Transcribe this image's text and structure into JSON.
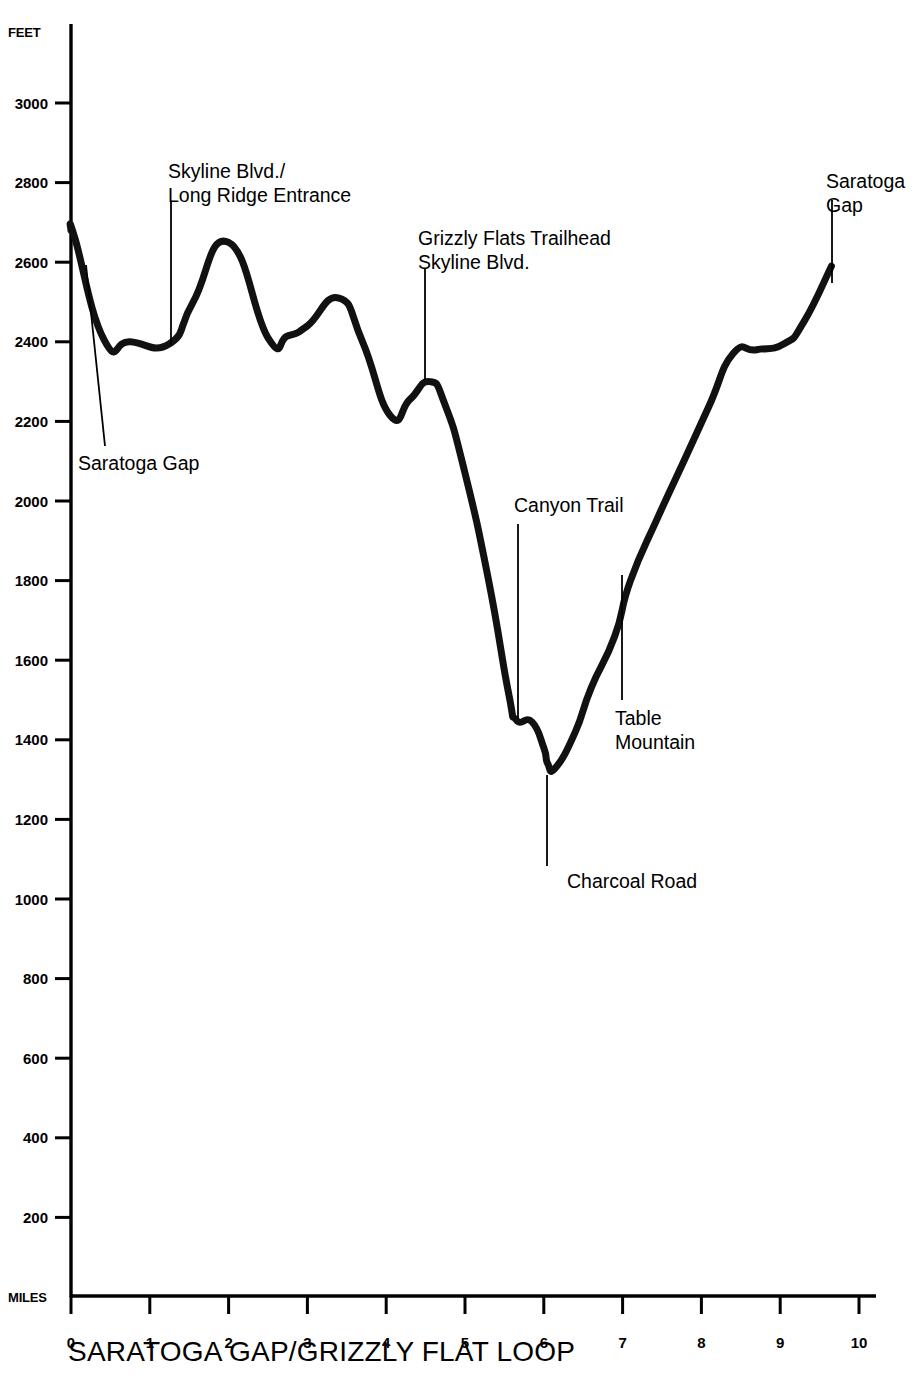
{
  "chart_data": {
    "type": "line",
    "title": "SARATOGA GAP/GRIZZLY FLAT LOOP",
    "xlabel": "MILES",
    "ylabel": "FEET",
    "xlim": [
      0,
      10
    ],
    "ylim": [
      0,
      3100
    ],
    "grid": false,
    "legend": "none",
    "x_ticks": [
      "0",
      "1",
      "2",
      "3",
      "4",
      "5",
      "6",
      "7",
      "8",
      "9",
      "10"
    ],
    "y_ticks": [
      "200",
      "400",
      "600",
      "800",
      "1000",
      "1200",
      "1400",
      "1600",
      "1800",
      "2000",
      "2200",
      "2400",
      "2600",
      "2800",
      "3000"
    ],
    "series": [
      {
        "name": "Elevation profile",
        "x": [
          0.0,
          0.05,
          0.42,
          0.75,
          1.25,
          1.55,
          2.0,
          2.5,
          2.75,
          3.0,
          3.4,
          3.7,
          4.05,
          4.3,
          4.55,
          4.75,
          5.0,
          5.3,
          5.55,
          5.65,
          5.85,
          6.0,
          6.05,
          6.15,
          6.4,
          6.6,
          6.9,
          7.1,
          7.45,
          7.8,
          8.1,
          8.4,
          8.7,
          9.05,
          9.3,
          9.65
        ],
        "y": [
          2680,
          2660,
          2405,
          2400,
          2395,
          2500,
          2650,
          2410,
          2415,
          2440,
          2510,
          2400,
          2215,
          2255,
          2300,
          2240,
          2070,
          1800,
          1520,
          1450,
          1445,
          1380,
          1340,
          1330,
          1420,
          1530,
          1660,
          1800,
          1960,
          2110,
          2240,
          2370,
          2380,
          2395,
          2450,
          2590
        ]
      }
    ],
    "annotations": [
      {
        "id": "saratoga-gap-start",
        "lines": [
          "Saratoga Gap"
        ],
        "mile": 0.05,
        "elevation": 2640,
        "text_x": 78,
        "text_y": 470,
        "leader_x1": 86,
        "leader_y1": 265,
        "leader_x2": 105,
        "leader_y2": 446
      },
      {
        "id": "skyline-blvd-long-ridge-entrance",
        "lines": [
          "Skyline Blvd./",
          "Long Ridge Entrance"
        ],
        "mile": 1.25,
        "elevation": 2395,
        "text_x": 168,
        "text_y": 178,
        "leader_x1": 171,
        "leader_y1": 201,
        "leader_x2": 171,
        "leader_y2": 345
      },
      {
        "id": "grizzly-flats-trailhead-skyline-blvd",
        "lines": [
          "Grizzly Flats Trailhead",
          "Skyline Blvd."
        ],
        "mile": 4.55,
        "elevation": 2300,
        "text_x": 418,
        "text_y": 245,
        "leader_x1": 425,
        "leader_y1": 268,
        "leader_x2": 425,
        "leader_y2": 380
      },
      {
        "id": "canyon-trail",
        "lines": [
          "Canyon Trail"
        ],
        "mile": 5.67,
        "elevation": 1450,
        "text_x": 514,
        "text_y": 512,
        "leader_x1": 518,
        "leader_y1": 524,
        "leader_x2": 518,
        "leader_y2": 718
      },
      {
        "id": "charcoal-road",
        "lines": [
          "Charcoal Road"
        ],
        "mile": 6.15,
        "elevation": 1330,
        "text_x": 567,
        "text_y": 888,
        "leader_x1": 547,
        "leader_y1": 775,
        "leader_x2": 547,
        "leader_y2": 866
      },
      {
        "id": "table-mountain",
        "lines": [
          "Table",
          "Mountain"
        ],
        "mile": 7.12,
        "elevation": 1805,
        "text_x": 615,
        "text_y": 725,
        "leader_x1": 622,
        "leader_y1": 575,
        "leader_x2": 622,
        "leader_y2": 700
      },
      {
        "id": "saratoga-gap-end",
        "lines": [
          "Saratoga",
          "Gap"
        ],
        "mile": 9.3,
        "elevation": 2455,
        "text_x": 826,
        "text_y": 188,
        "leader_x1": 832,
        "leader_y1": 200,
        "leader_x2": 832,
        "leader_y2": 283
      }
    ]
  },
  "axes": {
    "y_label": "FEET",
    "x_label": "MILES"
  },
  "title": {
    "text": "SARATOGA GAP/GRIZZLY FLAT LOOP"
  },
  "colors": {
    "ink": "#000000",
    "background": "#ffffff"
  }
}
